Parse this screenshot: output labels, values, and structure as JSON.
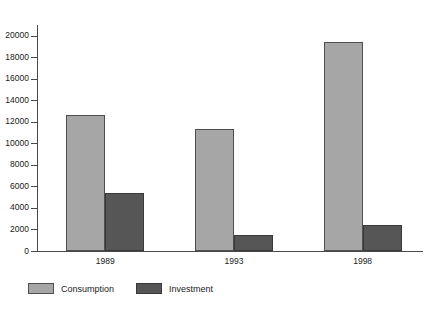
{
  "chart_data": {
    "type": "bar",
    "title": "",
    "subtitle": "",
    "xlabel": "",
    "ylabel": "",
    "categories": [
      "1989",
      "1993",
      "1998"
    ],
    "series": [
      {
        "name": "Consumption",
        "color": "#a6a6a6",
        "values": [
          12600,
          11300,
          19400
        ]
      },
      {
        "name": "Investment",
        "color": "#565656",
        "values": [
          5400,
          1500,
          2400
        ]
      }
    ],
    "ylim": [
      0,
      21000
    ],
    "ytick_values": [
      0,
      2000,
      4000,
      6000,
      8000,
      10000,
      12000,
      14000,
      16000,
      18000,
      20000
    ],
    "ytick_labels": [
      "0",
      "2000",
      "4000",
      "6000",
      "8000",
      "10000",
      "12000",
      "14000",
      "16000",
      "18000",
      "20000"
    ],
    "grid": false,
    "legend_position": "bottom-left",
    "axis_color": "#4a4a4a",
    "bar_border_color": "#4f4f4f",
    "background": "#ffffff"
  },
  "legend": {
    "items": [
      {
        "label": "Consumption"
      },
      {
        "label": "Investment"
      }
    ]
  },
  "axis": {
    "y_tick_labels": [
      "20000",
      "18000",
      "16000",
      "14000",
      "12000",
      "10000",
      "8000",
      "6000",
      "4000",
      "2000",
      "0"
    ],
    "x_tick_labels": [
      "1989",
      "1993",
      "1998"
    ]
  }
}
